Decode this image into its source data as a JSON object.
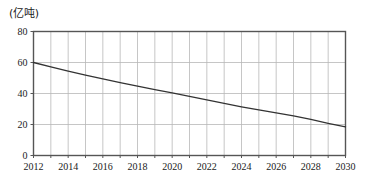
{
  "chart_data": {
    "type": "line",
    "title": "",
    "subtitle": "",
    "unit_label": "(亿吨)",
    "xlabel": "",
    "ylabel": "",
    "xlim": [
      2012,
      2030
    ],
    "ylim": [
      0,
      80
    ],
    "grid": true,
    "legend": false,
    "legend_position": "none",
    "x_tick_step": 2,
    "x_grid_step": 1,
    "y_tick_step": 20,
    "x_tick_labels": [
      "2012",
      "2014",
      "2016",
      "2018",
      "2020",
      "2022",
      "2024",
      "2026",
      "2028",
      "2030"
    ],
    "y_tick_labels": [
      "0",
      "20",
      "40",
      "60",
      "80"
    ],
    "x_tick_values": [
      2012,
      2014,
      2016,
      2018,
      2020,
      2022,
      2024,
      2026,
      2028,
      2030
    ],
    "y_tick_values": [
      0,
      20,
      40,
      60,
      80
    ],
    "line_color": "#333333",
    "grid_color": "#b8b8b8",
    "axis_color": "#555555",
    "background_color": "#ffffff",
    "x": [
      2012,
      2013,
      2014,
      2015,
      2016,
      2017,
      2018,
      2019,
      2020,
      2021,
      2022,
      2023,
      2024,
      2025,
      2026,
      2027,
      2028,
      2029,
      2030
    ],
    "values": [
      60.0,
      57.2,
      54.5,
      51.9,
      49.4,
      47.0,
      44.7,
      42.5,
      40.4,
      38.2,
      35.9,
      33.6,
      31.4,
      29.4,
      27.5,
      25.6,
      23.3,
      20.8,
      18.4
    ],
    "series": [
      {
        "name": "",
        "values": [
          60.0,
          57.2,
          54.5,
          51.9,
          49.4,
          47.0,
          44.7,
          42.5,
          40.4,
          38.2,
          35.9,
          33.6,
          31.4,
          29.4,
          27.5,
          25.6,
          23.3,
          20.8,
          18.4
        ]
      }
    ],
    "annotations": []
  }
}
